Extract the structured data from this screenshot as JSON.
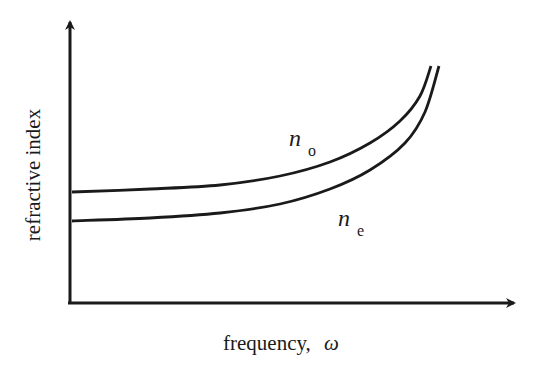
{
  "chart_data": {
    "type": "line",
    "title": "",
    "xlabel": "frequency,",
    "xlabel_symbol": "ω",
    "ylabel": "refractive index",
    "grid": false,
    "legend": "inline curve labels",
    "axis_ticks": "none",
    "series": [
      {
        "name": "n_o",
        "label_main": "n",
        "label_sub": "o",
        "description": "ordinary refractive index, upper curve",
        "points_px": [
          [
            72,
            192
          ],
          [
            150,
            189
          ],
          [
            220,
            185
          ],
          [
            280,
            176
          ],
          [
            330,
            162
          ],
          [
            370,
            143
          ],
          [
            400,
            121
          ],
          [
            420,
            96
          ],
          [
            431,
            66
          ]
        ]
      },
      {
        "name": "n_e",
        "label_main": "n",
        "label_sub": "e",
        "description": "extraordinary refractive index, lower curve",
        "points_px": [
          [
            72,
            221
          ],
          [
            150,
            218
          ],
          [
            220,
            213
          ],
          [
            280,
            204
          ],
          [
            330,
            189
          ],
          [
            370,
            170
          ],
          [
            405,
            143
          ],
          [
            425,
            112
          ],
          [
            439,
            66
          ]
        ]
      }
    ],
    "annotation": "Both curves rise slowly then diverge upward near resonance; n_o lies above n_e"
  },
  "colors": {
    "line": "#1a1a1a",
    "background": "#ffffff"
  }
}
